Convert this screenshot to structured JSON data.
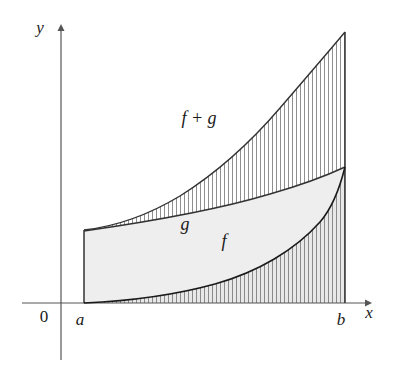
{
  "figure": {
    "type": "calculus-area-diagram",
    "background_color": "#ffffff",
    "axes": {
      "x_axis": {
        "label": "x",
        "label_x": 369,
        "label_y": 318,
        "line_y": 303,
        "line_x_start": 22,
        "line_x_end": 366,
        "arrow_tip_x": 374,
        "color": "#555555"
      },
      "y_axis": {
        "label": "y",
        "label_x": 40,
        "label_y": 33,
        "line_x": 61,
        "line_y_start": 28,
        "line_y_end": 360,
        "arrow_tip_y": 24,
        "color": "#555555"
      },
      "origin": {
        "label": "0",
        "label_x": 44,
        "label_y": 322
      }
    },
    "endpoints": [
      {
        "name": "a",
        "label": "a",
        "x": 84,
        "label_x": 78,
        "label_y": 325
      },
      {
        "name": "b",
        "label": "b",
        "x": 345,
        "label_x": 339,
        "label_y": 325
      }
    ],
    "curves": [
      {
        "name": "f-plus-g",
        "label": "f + g",
        "label_x": 199,
        "label_y": 124,
        "stroke": "#333333",
        "stroke_width": 1.4,
        "path": "M 84,230 C 120,226 150,214 180,196 C 215,174 250,143 280,108 C 305,79 330,50 345,32",
        "points": [
          {
            "x": 84,
            "y": 230
          },
          {
            "x": 120,
            "y": 224
          },
          {
            "x": 150,
            "y": 212
          },
          {
            "x": 180,
            "y": 195
          },
          {
            "x": 215,
            "y": 172
          },
          {
            "x": 250,
            "y": 143
          },
          {
            "x": 280,
            "y": 108
          },
          {
            "x": 310,
            "y": 75
          },
          {
            "x": 345,
            "y": 32
          }
        ]
      },
      {
        "name": "g",
        "label": "g",
        "label_x": 183,
        "label_y": 230,
        "stroke": "#333333",
        "stroke_width": 1.4,
        "path": "M 84,231 C 140,223 210,212 270,194 C 305,184 330,174 345,167",
        "points": [
          {
            "x": 84,
            "y": 231
          },
          {
            "x": 140,
            "y": 222
          },
          {
            "x": 200,
            "y": 212
          },
          {
            "x": 260,
            "y": 197
          },
          {
            "x": 310,
            "y": 181
          },
          {
            "x": 345,
            "y": 167
          }
        ]
      },
      {
        "name": "f",
        "label": "f",
        "label_x": 223,
        "label_y": 247,
        "stroke": "#1a1a1a",
        "stroke_width": 1.6,
        "path": "M 84,303 C 130,301 175,295 215,284 C 258,272 295,250 320,222 C 334,206 341,183 345,167",
        "points": [
          {
            "x": 84,
            "y": 303
          },
          {
            "x": 130,
            "y": 300
          },
          {
            "x": 175,
            "y": 294
          },
          {
            "x": 215,
            "y": 284
          },
          {
            "x": 255,
            "y": 269
          },
          {
            "x": 290,
            "y": 247
          },
          {
            "x": 320,
            "y": 220
          },
          {
            "x": 345,
            "y": 167
          }
        ]
      }
    ],
    "regions": [
      {
        "name": "region-g",
        "description": "solid light gray band between the f curve and the g curve",
        "fill": "#eeeeee",
        "hatch": "none"
      },
      {
        "name": "region-f",
        "description": "vertically hatched region under the f curve, from x-axis up to f",
        "fill": "#e2e2e2",
        "hatch": "vertical",
        "hatch_spacing": 4,
        "hatch_color": "#8a8a8a"
      },
      {
        "name": "region-f-plus-g",
        "description": "vertically hatched region between the g curve and the f+g curve",
        "fill": "#ffffff",
        "hatch": "vertical",
        "hatch_spacing": 4,
        "hatch_color": "#8a8a8a"
      }
    ],
    "vertical_edges": [
      {
        "name": "left-edge-at-a",
        "x": 84,
        "y_top": 230,
        "y_bottom": 303
      },
      {
        "name": "right-edge-at-b",
        "x": 345,
        "y_top": 32,
        "y_bottom": 303
      }
    ]
  }
}
